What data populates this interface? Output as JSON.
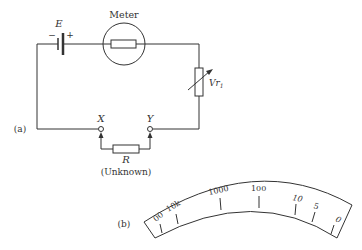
{
  "circuit": {
    "battery_label": "E",
    "battery_minus": "−",
    "battery_plus": "+",
    "meter_label": "Meter",
    "variable_resistor_label": "Vr",
    "variable_resistor_subscript": "1",
    "terminal_x": "X",
    "terminal_y": "Y",
    "unknown_resistor_label": "R",
    "unknown_caption": "(Unknown)",
    "panel_label": "(a)"
  },
  "scale": {
    "panel_label": "(b)",
    "ticks": [
      "00",
      "10k",
      "1000",
      "100",
      "10",
      "5",
      "0"
    ]
  }
}
